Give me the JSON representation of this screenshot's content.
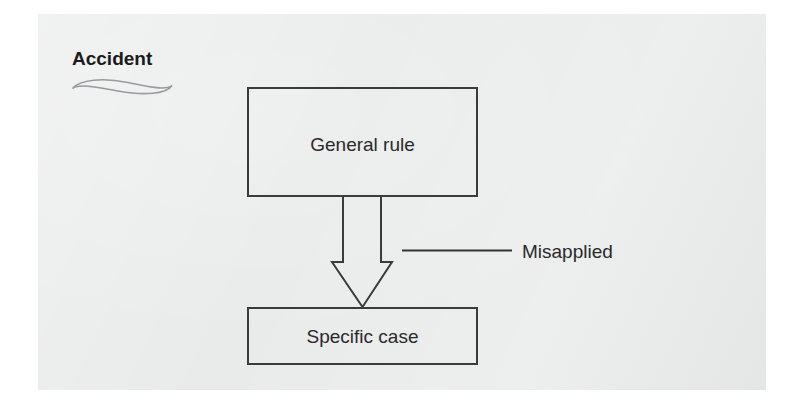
{
  "figure": {
    "background_color": "#ffffff",
    "page_color": "#e9eaea",
    "ink_color": "#3b3b3b",
    "squiggle_color": "#9a9a9e"
  },
  "annotation": {
    "label": "Accident",
    "squiggle_icon": "hand-drawn-lens-squiggle"
  },
  "nodes": [
    {
      "id": "general-rule",
      "label": "General rule"
    },
    {
      "id": "specific-case",
      "label": "Specific case"
    }
  ],
  "edges": [
    {
      "id": "general-to-specific",
      "from": "general-rule",
      "to": "specific-case",
      "style": "hollow-block-arrow",
      "label": "Misapplied"
    }
  ],
  "callout": {
    "label": "Misapplied",
    "leader_icon": "leader-line"
  }
}
